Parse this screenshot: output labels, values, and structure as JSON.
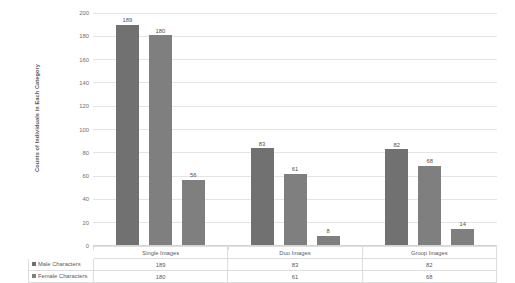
{
  "chart_data": {
    "type": "bar",
    "title": "",
    "xlabel": "",
    "ylabel": "Counts of Individuals in Each Category",
    "categories": [
      "Single Images",
      "Duo Images",
      "Group Images"
    ],
    "series": [
      {
        "name": "Male Characters",
        "values": [
          189,
          180,
          83
        ],
        "color": "#717171"
      },
      {
        "name": "Female Characters",
        "values": [
          180,
          61,
          68
        ],
        "color": "#7f7f7f"
      },
      {
        "name": "",
        "values": [
          56,
          8,
          14
        ],
        "color": "#7f7f7f"
      }
    ],
    "bars": [
      {
        "group": "Single Images",
        "series_index": 0,
        "value": 189,
        "label": "189"
      },
      {
        "group": "Single Images",
        "series_index": 1,
        "value": 180,
        "label": "180"
      },
      {
        "group": "Single Images",
        "series_index": 2,
        "value": 56,
        "label": "56"
      },
      {
        "group": "Duo Images",
        "series_index": 0,
        "value": 83,
        "label": "83"
      },
      {
        "group": "Duo Images",
        "series_index": 1,
        "value": 61,
        "label": "61"
      },
      {
        "group": "Duo Images",
        "series_index": 2,
        "value": 8,
        "label": "8"
      },
      {
        "group": "Group Images",
        "series_index": 0,
        "value": 82,
        "label": "82"
      },
      {
        "group": "Group Images",
        "series_index": 1,
        "value": 68,
        "label": "68"
      },
      {
        "group": "Group Images",
        "series_index": 2,
        "value": 14,
        "label": "14"
      }
    ],
    "ylim": [
      0,
      200
    ],
    "yticks": [
      0,
      20,
      40,
      60,
      80,
      100,
      120,
      140,
      160,
      180,
      200
    ],
    "ytick_labels": [
      "0",
      "20",
      "40",
      "60",
      "80",
      "100",
      "120",
      "140",
      "160",
      "180",
      "200"
    ],
    "grid": true,
    "legend_position": "bottom-table",
    "colors": {
      "bar_series_1": "#717171",
      "bar_series_2": "#7f7f7f",
      "bar_series_3": "#7f7f7f",
      "gridline": "#e4e4e4",
      "text": "#5a5a5a",
      "table_border": "#dedede"
    }
  },
  "axis": {
    "y_title": "Counts of Individuals in Each Category",
    "ticks": [
      "200",
      "180",
      "160",
      "140",
      "120",
      "100",
      "80",
      "60",
      "40",
      "20",
      "0"
    ]
  },
  "bar_labels": {
    "single_male": "189",
    "single_female": "180",
    "single_third": "56",
    "duo_male": "83",
    "duo_female": "61",
    "duo_third": "8",
    "group_male": "82",
    "group_female": "68",
    "group_third": "14"
  },
  "data_table": {
    "header": {
      "blank": "",
      "columns": [
        "Single Images",
        "Duo Images",
        "Group Images"
      ]
    },
    "rows": [
      {
        "legend": "Male Characters",
        "values": [
          "189",
          "83",
          "82"
        ]
      },
      {
        "legend": "Female Characters",
        "values": [
          "180",
          "61",
          "68"
        ]
      }
    ]
  }
}
